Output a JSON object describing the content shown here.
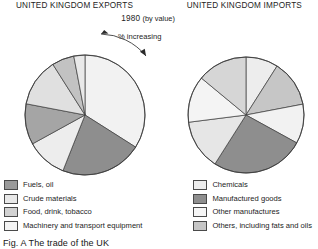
{
  "figure": {
    "caption": "Fig. A  The trade of the UK",
    "subtitle_year": "1980",
    "subtitle_note": "(by value)",
    "annotation": "% increasing",
    "titles": {
      "left": "UNITED KINGDOM EXPORTS",
      "right": "UNITED KINGDOM IMPORTS"
    }
  },
  "colors": {
    "fuels_oil": "#9a9a9a",
    "crude_materials": "#e4e4e4",
    "food_drink_tobacco": "#cfcfcf",
    "machinery_transport": "#f2f2f2",
    "chemicals": "#ededed",
    "manufactured_goods": "#8e8e8e",
    "other_manufactures": "#f4f4f4",
    "others_fats_oils": "#c6c6c6",
    "outline": "#3c3c3c",
    "background": "#ffffff"
  },
  "legend": {
    "left_items": [
      {
        "label": "Fuels, oil",
        "color": "#9a9a9a"
      },
      {
        "label": "Crude materials",
        "color": "#e8e8e8"
      },
      {
        "label": "Food, drink, tobacco",
        "color": "#d2d2d2"
      },
      {
        "label": "Machinery and transport equipment",
        "color": "#f4f4f4"
      }
    ],
    "right_items": [
      {
        "label": "Chemicals",
        "color": "#ededed"
      },
      {
        "label": "Manufactured goods",
        "color": "#8e8e8e"
      },
      {
        "label": "Other manufactures",
        "color": "#f6f6f6"
      },
      {
        "label": "Others, including fats and oils",
        "color": "#c6c6c6"
      }
    ]
  },
  "chart_data": [
    {
      "type": "pie",
      "title": "UNITED KINGDOM EXPORTS",
      "subtitle": "1980 (by value)",
      "unit": "percent of total value",
      "start_angle_deg": 0,
      "direction": "clockwise",
      "legend_position": "bottom-left",
      "categories": [
        "Machinery and transport equipment",
        "Manufactured goods",
        "Other manufactures",
        "Chemicals",
        "Fuels, oil",
        "Food, drink, tobacco",
        "Crude materials"
      ],
      "values": [
        34,
        22,
        11,
        11,
        13,
        6,
        3
      ],
      "slices": [
        {
          "label": "Machinery and transport equipment",
          "value": 34,
          "color": "#f2f2f2"
        },
        {
          "label": "Manufactured goods",
          "value": 22,
          "color": "#8e8e8e"
        },
        {
          "label": "Other manufactures",
          "value": 11,
          "color": "#ededed"
        },
        {
          "label": "Chemicals",
          "value": 11,
          "color": "#a5a5a5"
        },
        {
          "label": "Fuels, oil",
          "value": 13,
          "color": "#e0e0e0"
        },
        {
          "label": "Food, drink, tobacco",
          "value": 6,
          "color": "#c2c2c2"
        },
        {
          "label": "Crude materials",
          "value": 3,
          "color": "#e9e9e9"
        }
      ]
    },
    {
      "type": "pie",
      "title": "UNITED KINGDOM IMPORTS",
      "subtitle": "1980 (by value)",
      "unit": "percent of total value",
      "start_angle_deg": 0,
      "direction": "clockwise",
      "legend_position": "bottom-right",
      "categories": [
        "Other manufactures",
        "Others, including fats and oils",
        "Chemicals",
        "Manufactured goods",
        "Fuels, oil",
        "Food, drink, tobacco",
        "Crude materials"
      ],
      "values": [
        9,
        13,
        11,
        26,
        14,
        13,
        14
      ],
      "slices": [
        {
          "label": "Other manufactures",
          "value": 9,
          "color": "#ededed"
        },
        {
          "label": "Others, including fats and oils",
          "value": 13,
          "color": "#c6c6c6"
        },
        {
          "label": "Chemicals",
          "value": 11,
          "color": "#f2f2f2"
        },
        {
          "label": "Manufactured goods",
          "value": 26,
          "color": "#8e8e8e"
        },
        {
          "label": "Fuels, oil",
          "value": 14,
          "color": "#e6e6e6"
        },
        {
          "label": "Food, drink, tobacco",
          "value": 13,
          "color": "#f4f4f4"
        },
        {
          "label": "Crude materials",
          "value": 14,
          "color": "#d6d6d6"
        }
      ]
    }
  ]
}
